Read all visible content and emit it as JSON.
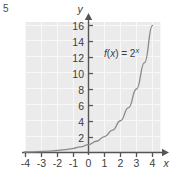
{
  "exercise": {
    "number": "5"
  },
  "chart_data": {
    "type": "line",
    "title": "",
    "function_label": "f(x) = 2",
    "function_label_exponent": "x",
    "function_expression": "f(x) = 2^x",
    "xlabel": "x",
    "ylabel": "y",
    "xlim": [
      -4.4,
      4.4
    ],
    "ylim": [
      -1.1,
      17.2
    ],
    "xticks": [
      "-4",
      "-3",
      "-2",
      "-1",
      "0",
      "1",
      "2",
      "3",
      "4"
    ],
    "xtick_values": [
      -4,
      -3,
      -2,
      -1,
      0,
      1,
      2,
      3,
      4
    ],
    "yticks": [
      "2",
      "4",
      "6",
      "8",
      "10",
      "12",
      "14",
      "16"
    ],
    "ytick_values": [
      2,
      4,
      6,
      8,
      10,
      12,
      14,
      16
    ],
    "grid": true,
    "legend": "none",
    "series": [
      {
        "name": "f(x) = 2^x",
        "color": "#8a8a8a",
        "x": [
          -4,
          -3.5,
          -3,
          -2.5,
          -2,
          -1.5,
          -1,
          -0.5,
          0,
          0.5,
          1,
          1.5,
          2,
          2.5,
          3,
          3.5,
          4
        ],
        "values": [
          0.0625,
          0.0884,
          0.125,
          0.1768,
          0.25,
          0.3536,
          0.5,
          0.7071,
          1,
          1.4142,
          2,
          2.8284,
          4,
          5.6569,
          8,
          11.3137,
          16
        ]
      }
    ],
    "plot_background": "#ebebeb",
    "grid_color": "#f7f7f7",
    "axis_color": "#555555",
    "curve_color": "#8a8a8a"
  }
}
